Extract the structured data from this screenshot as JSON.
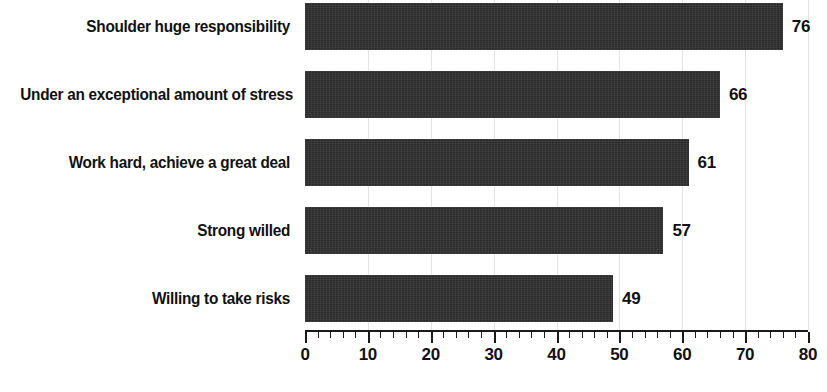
{
  "chart_data": {
    "type": "bar",
    "orientation": "horizontal",
    "title": "",
    "subtitle": "",
    "xlabel": "",
    "ylabel": "",
    "xlim": [
      0,
      80
    ],
    "grid": true,
    "legend": null,
    "categories": [
      "Shoulder huge responsibility",
      "Under an exceptional amount of stress",
      "Work hard, achieve a great deal",
      "Strong willed",
      "Willing to take risks"
    ],
    "values": [
      76,
      66,
      61,
      57,
      49
    ],
    "value_labels": [
      "76",
      "66",
      "61",
      "57",
      "49"
    ],
    "tick_labels": [
      "0",
      "10",
      "20",
      "30",
      "40",
      "50",
      "60",
      "70",
      "80"
    ],
    "tick_values": [
      0,
      10,
      20,
      30,
      40,
      50,
      60,
      70,
      80
    ],
    "minor_tick_step": 2,
    "bar_color": "#2b2b2b",
    "grid_color": "#e3e3e3",
    "axis_color": "#1a1a1a",
    "text_color": "#111111",
    "background_color": "#ffffff"
  }
}
